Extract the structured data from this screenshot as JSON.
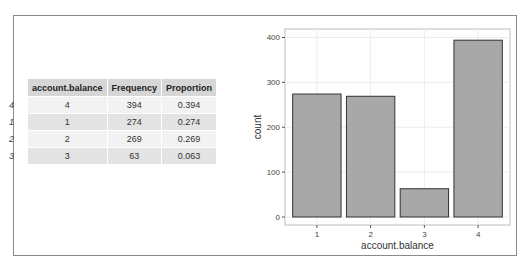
{
  "table": {
    "headers": [
      "",
      "account.balance",
      "Frequency",
      "Proportion"
    ],
    "rows": [
      {
        "rowname": "4",
        "account_balance": "4",
        "frequency": "394",
        "proportion": "0.394"
      },
      {
        "rowname": "1",
        "account_balance": "1",
        "frequency": "274",
        "proportion": "0.274"
      },
      {
        "rowname": "2",
        "account_balance": "2",
        "frequency": "269",
        "proportion": "0.269"
      },
      {
        "rowname": "3",
        "account_balance": "3",
        "frequency": "63",
        "proportion": "0.063"
      }
    ]
  },
  "chart_data": {
    "type": "bar",
    "title": "",
    "xlabel": "account.balance",
    "ylabel": "count",
    "categories": [
      "1",
      "2",
      "3",
      "4"
    ],
    "values": [
      274,
      269,
      63,
      394
    ],
    "ylim": [
      0,
      410
    ],
    "yticks": [
      0,
      100,
      200,
      300,
      400
    ],
    "grid": true,
    "bar_fill": "#a8a8a8",
    "bar_stroke": "#333333",
    "legend": null
  }
}
